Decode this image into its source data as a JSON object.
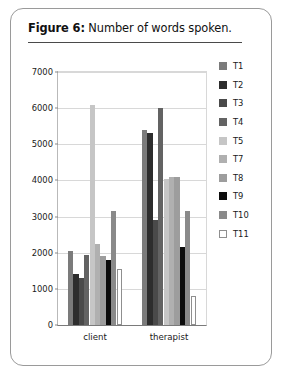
{
  "figure": {
    "number_label": "Figure 6:",
    "caption_text": " Number of words spoken."
  },
  "chart_data": {
    "type": "bar",
    "title": "Number of words spoken.",
    "xlabel": "",
    "ylabel": "",
    "categories": [
      "client",
      "therapist"
    ],
    "ylim": [
      0,
      7000
    ],
    "ytick_labels": [
      "0",
      "1000",
      "2000",
      "3000",
      "4000",
      "5000",
      "6000",
      "7000"
    ],
    "ytick_values": [
      0,
      1000,
      2000,
      3000,
      4000,
      5000,
      6000,
      7000
    ],
    "grid": true,
    "legend_position": "right",
    "series": [
      {
        "name": "T1",
        "color": "#7b7b7b",
        "values": [
          2050,
          5400
        ]
      },
      {
        "name": "T2",
        "color": "#2d2d2d",
        "values": [
          1400,
          5300
        ]
      },
      {
        "name": "T3",
        "color": "#4a4a4a",
        "values": [
          1300,
          2900
        ]
      },
      {
        "name": "T4",
        "color": "#636363",
        "values": [
          1950,
          6000
        ]
      },
      {
        "name": "T5",
        "color": "#c6c6c6",
        "values": [
          6100,
          4050
        ]
      },
      {
        "name": "T7",
        "color": "#b0b0b0",
        "values": [
          2250,
          4100
        ]
      },
      {
        "name": "T8",
        "color": "#9d9d9d",
        "values": [
          1900,
          4100
        ]
      },
      {
        "name": "T9",
        "color": "#0d0d0d",
        "values": [
          1800,
          2150
        ]
      },
      {
        "name": "T10",
        "color": "#8a8a8a",
        "values": [
          3150,
          3150
        ]
      },
      {
        "name": "T11",
        "color": "#ffffff",
        "values": [
          1550,
          800
        ]
      }
    ]
  },
  "legend": {
    "items": [
      {
        "label": "T1",
        "color": "#7b7b7b"
      },
      {
        "label": "T2",
        "color": "#2d2d2d"
      },
      {
        "label": "T3",
        "color": "#4a4a4a"
      },
      {
        "label": "T4",
        "color": "#636363"
      },
      {
        "label": "T5",
        "color": "#c6c6c6"
      },
      {
        "label": "T7",
        "color": "#b0b0b0"
      },
      {
        "label": "T8",
        "color": "#9d9d9d"
      },
      {
        "label": "T9",
        "color": "#0d0d0d"
      },
      {
        "label": "T10",
        "color": "#8a8a8a"
      },
      {
        "label": "T11",
        "color": "#ffffff"
      }
    ]
  }
}
